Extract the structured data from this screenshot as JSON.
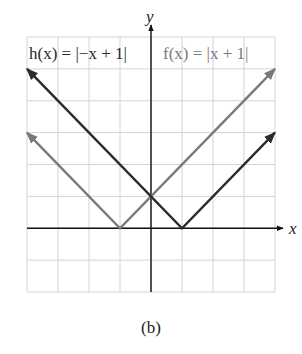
{
  "chart_data": {
    "type": "line",
    "title": "",
    "xlabel": "x",
    "ylabel": "y",
    "xlim": [
      -4,
      4
    ],
    "ylim": [
      -2,
      6
    ],
    "grid": true,
    "tick_labels": false,
    "series": [
      {
        "name": "f(x) = |x + 1|",
        "color": "#7a7a7a",
        "x": [
          -4,
          -1,
          4
        ],
        "y": [
          3,
          0,
          5
        ],
        "label_text": "f(x) = |x + 1|"
      },
      {
        "name": "h(x) = |−x + 1|",
        "color": "#2b2b2b",
        "x": [
          -4,
          1,
          4
        ],
        "y": [
          5,
          0,
          3
        ],
        "label_text": "h(x) = |−x + 1|"
      }
    ],
    "annotations": [
      "h(x) = |−x + 1|",
      "f(x) = |x + 1|"
    ]
  },
  "caption": "(b)",
  "axes": {
    "x_label": "x",
    "y_label": "y"
  }
}
